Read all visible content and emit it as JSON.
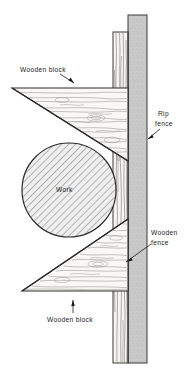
{
  "figure": {
    "background_color": "#ffffff",
    "line_color": "#1a1a1a",
    "labels": [
      {
        "id": "wooden-block-top",
        "text": "Wooden block",
        "x": 20,
        "y": 71,
        "leader": {
          "from_x": 60,
          "from_y": 74,
          "to_x": 74,
          "to_y": 83
        }
      },
      {
        "id": "rip-fence",
        "text_line_1": "Rip",
        "text_line_2": "fence",
        "x": 158,
        "y": 115,
        "leader": {
          "from_x": 158,
          "from_y": 128,
          "to_x": 147,
          "to_y": 138
        }
      },
      {
        "id": "work",
        "text": "Work",
        "x": 55,
        "y": 192
      },
      {
        "id": "wooden-fence",
        "text_line_1": "Wooden",
        "text_line_2": "fence",
        "x": 152,
        "y": 234,
        "leader": {
          "from_x": 151,
          "from_y": 244,
          "to_x": 126,
          "to_y": 262
        }
      },
      {
        "id": "wooden-block-bottom",
        "text": "Wooden block",
        "x": 48,
        "y": 320,
        "leader": {
          "from_x": 73,
          "from_y": 311,
          "to_x": 73,
          "to_y": 300
        }
      }
    ],
    "parts": {
      "rip_fence": {
        "name": "Rip fence",
        "fill_color": "#c9c9c9",
        "x": 128,
        "y": 15,
        "width": 19,
        "height": 348
      },
      "wooden_fence": {
        "name": "Wooden fence",
        "fill_color": "#f4f2ee",
        "x": 113,
        "y": 32,
        "width": 15,
        "height": 331
      },
      "work": {
        "name": "Work",
        "shape": "circle",
        "center_x": 69,
        "center_y": 190,
        "radius": 47,
        "hatch": "45-degree"
      },
      "block_top": {
        "name": "Wooden block (top)",
        "shape": "triangle",
        "points": "12,88 128,88 128,161"
      },
      "block_bottom": {
        "name": "Wooden block (bottom)",
        "shape": "triangle",
        "points": "22,291 128,291 128,219"
      }
    }
  }
}
